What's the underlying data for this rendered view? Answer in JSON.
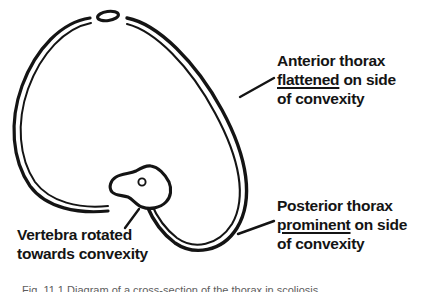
{
  "figure": {
    "line_color": "#141414",
    "background_color": "#ffffff",
    "parts": {
      "sternum": "sternum-ellipse",
      "ribcage": "ribcage-outline",
      "vertebra": "rotated-vertebra",
      "spinal_canal": "spinal-canal-circle"
    }
  },
  "annotations": {
    "anterior": {
      "line1": "Anterior thorax",
      "line2_underlined": "flattened",
      "line2_rest": " on side",
      "line3": "of convexity"
    },
    "posterior": {
      "line1": "Posterior thorax",
      "line2_underlined": "prominent",
      "line2_rest": " on side",
      "line3": "of convexity"
    },
    "vertebra": {
      "line1": "Vertebra rotated",
      "line2": "towards convexity"
    }
  },
  "caption": {
    "text": "Fig. 11.1 Diagram of a cross-section of the thorax in scoliosis"
  }
}
